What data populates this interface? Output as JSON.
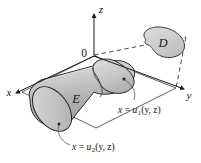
{
  "figure": {
    "background_color": "#ffffff",
    "width": 201,
    "height": 163
  },
  "axes": {
    "z_label": "z",
    "x_label": "x",
    "y_label": "y",
    "origin_label": "0"
  },
  "regions": {
    "solid_label": "E",
    "projection_label": "D"
  },
  "surfaces": {
    "front": {
      "text_x": "x",
      "text_eq": "=",
      "text_u": "u",
      "text_sub": "1",
      "text_args": "(y, z)"
    },
    "back": {
      "text_x": "x",
      "text_eq": "=",
      "text_u": "u",
      "text_sub": "2",
      "text_args": "(y, z)"
    }
  },
  "colors": {
    "stroke": "#1a1a1a",
    "solid_fill_light": "#d8d8d8",
    "solid_fill_mid": "#bcbcbc",
    "solid_fill_dark": "#a2a2a2",
    "cap_fill": "#c8c8c8",
    "projection_fill": "#cfcfcf",
    "dashed_stroke": "#2b2b2b"
  }
}
